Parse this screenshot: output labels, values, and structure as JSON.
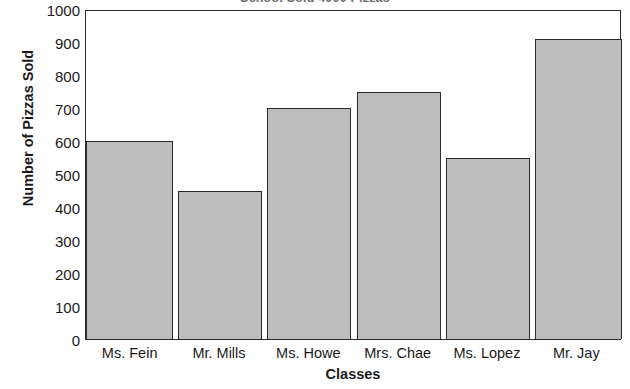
{
  "chart_data": {
    "type": "bar",
    "title": "School Sold 4000 Pizzas",
    "xlabel": "Classes",
    "ylabel": "Number of Pizzas Sold",
    "categories": [
      "Ms. Fein",
      "Mr. Mills",
      "Ms. Howe",
      "Mrs. Chae",
      "Ms. Lopez",
      "Mr. Jay"
    ],
    "values": [
      600,
      450,
      700,
      750,
      550,
      910
    ],
    "ylim": [
      0,
      1000
    ],
    "ytick_labels": [
      "1000",
      "900",
      "800",
      "700",
      "600",
      "500",
      "400",
      "300",
      "200",
      "100",
      "0"
    ],
    "ytick_values": [
      1000,
      900,
      800,
      700,
      600,
      500,
      400,
      300,
      200,
      100,
      0
    ],
    "ytick_step": 100,
    "grid": false,
    "legend": false,
    "bar_fill_color": "#bdbdbd",
    "bar_border_color": "#2b2b2b",
    "axis_color": "#2b2b2b",
    "background_color": "#ffffff"
  }
}
